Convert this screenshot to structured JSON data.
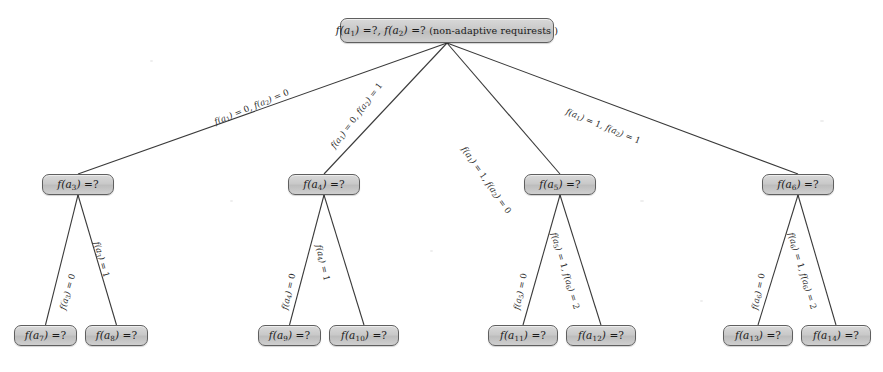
{
  "figure": {
    "type": "decision-tree",
    "width": 883,
    "height": 372,
    "background_color": "#ffffff",
    "node_fill_color": "#c9c9c9",
    "node_border_color": "#5f5f5f",
    "edge_color": "#3a3a3a",
    "text_color": "#1a1a1a"
  },
  "nodes": {
    "root": {
      "id": "root",
      "label": "f(a1) =?, f(a2) =? (non-adaptive requirests )",
      "level": 0,
      "x": 340,
      "y": 18,
      "width": 214,
      "height": 25
    },
    "level1": [
      {
        "id": "n-a3",
        "label": "f(a3) =?",
        "x": 42,
        "y": 174,
        "width": 72,
        "height": 21
      },
      {
        "id": "n-a4",
        "label": "f(a4) =?",
        "x": 288,
        "y": 174,
        "width": 72,
        "height": 21
      },
      {
        "id": "n-a5",
        "label": "f(a5) =?",
        "x": 524,
        "y": 174,
        "width": 72,
        "height": 21
      },
      {
        "id": "n-a6",
        "label": "f(a6) =?",
        "x": 762,
        "y": 174,
        "width": 72,
        "height": 21
      }
    ],
    "level2": [
      {
        "id": "n-a7",
        "label": "f(a7) =?",
        "x": 14,
        "y": 325,
        "width": 63,
        "height": 21
      },
      {
        "id": "n-a8",
        "label": "f(a8) =?",
        "x": 85,
        "y": 325,
        "width": 63,
        "height": 21
      },
      {
        "id": "n-a9",
        "label": "f(a9) =?",
        "x": 258,
        "y": 325,
        "width": 63,
        "height": 21
      },
      {
        "id": "n-a10",
        "label": "f(a10) =?",
        "x": 329,
        "y": 325,
        "width": 70,
        "height": 21
      },
      {
        "id": "n-a11",
        "label": "f(a11) =?",
        "x": 488,
        "y": 325,
        "width": 70,
        "height": 21
      },
      {
        "id": "n-a12",
        "label": "f(a12) =?",
        "x": 566,
        "y": 325,
        "width": 70,
        "height": 21
      },
      {
        "id": "n-a13",
        "label": "f(a13) =?",
        "x": 723,
        "y": 325,
        "width": 70,
        "height": 21
      },
      {
        "id": "n-a14",
        "label": "f(a14) =?",
        "x": 801,
        "y": 325,
        "width": 70,
        "height": 21
      }
    ]
  },
  "edges": [
    {
      "id": "e-root-a3",
      "from": "root",
      "to": "n-a3",
      "label": "f(a1) = 0, f(a2) = 0"
    },
    {
      "id": "e-root-a4",
      "from": "root",
      "to": "n-a4",
      "label": "f(a1) = 0, f(a2) = 1"
    },
    {
      "id": "e-root-a5",
      "from": "root",
      "to": "n-a5",
      "label": "f(a1) = 1, f(a2) = 0"
    },
    {
      "id": "e-root-a6",
      "from": "root",
      "to": "n-a6",
      "label": "f(a1) = 1, f(a2) = 1"
    },
    {
      "id": "e-a3-a7",
      "from": "n-a3",
      "to": "n-a7",
      "label": "f(a3) = 0"
    },
    {
      "id": "e-a3-a8",
      "from": "n-a3",
      "to": "n-a8",
      "label": "f(a3) = 1"
    },
    {
      "id": "e-a4-a9",
      "from": "n-a4",
      "to": "n-a9",
      "label": "f(a4) = 0"
    },
    {
      "id": "e-a4-a10",
      "from": "n-a4",
      "to": "n-a10",
      "label": "f(a4) = 1"
    },
    {
      "id": "e-a5-a11",
      "from": "n-a5",
      "to": "n-a11",
      "label": "f(a5) = 0"
    },
    {
      "id": "e-a5-a12",
      "from": "n-a5",
      "to": "n-a12",
      "label": "f(a5) = 1, f(a6) = 2"
    },
    {
      "id": "e-a6-a13",
      "from": "n-a6",
      "to": "n-a13",
      "label": "f(a6) = 0"
    },
    {
      "id": "e-a6-a14",
      "from": "n-a6",
      "to": "n-a14",
      "label": "f(a6) = 1, f(a6) = 2"
    }
  ],
  "edge_label_layout": [
    {
      "id": "e-root-a3",
      "x": 215,
      "y": 118,
      "rotate": -22.5
    },
    {
      "id": "e-root-a4",
      "x": 333,
      "y": 143,
      "rotate": -53.0
    },
    {
      "id": "e-root-a5",
      "x": 463,
      "y": 143,
      "rotate": 55.0
    },
    {
      "id": "e-root-a6",
      "x": 566,
      "y": 107,
      "rotate": 22.0
    },
    {
      "id": "e-a3-a7",
      "x": 63,
      "y": 305,
      "rotate": -74.0
    },
    {
      "id": "e-a3-a8",
      "x": 96,
      "y": 237,
      "rotate": 74.0
    },
    {
      "id": "e-a4-a9",
      "x": 285,
      "y": 305,
      "rotate": -77.0
    },
    {
      "id": "e-a4-a10",
      "x": 318,
      "y": 240,
      "rotate": 77.0
    },
    {
      "id": "e-a5-a11",
      "x": 517,
      "y": 305,
      "rotate": -78.0
    },
    {
      "id": "e-a5-a12",
      "x": 553,
      "y": 228,
      "rotate": 73.0
    },
    {
      "id": "e-a6-a13",
      "x": 755,
      "y": 305,
      "rotate": -78.0
    },
    {
      "id": "e-a6-a14",
      "x": 790,
      "y": 228,
      "rotate": 73.0
    }
  ]
}
